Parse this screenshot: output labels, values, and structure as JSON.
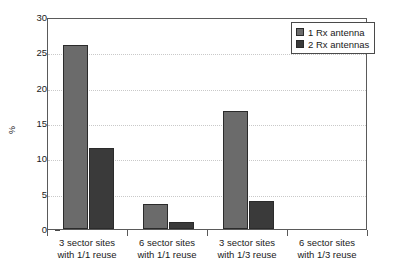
{
  "chart_data": {
    "type": "bar",
    "title": "",
    "xlabel": "",
    "ylabel": "%",
    "ylim": [
      0,
      30
    ],
    "ytick_labels": [
      "30",
      "25",
      "20",
      "15",
      "10",
      "5",
      "0"
    ],
    "yticks": [
      30,
      25,
      20,
      15,
      10,
      5,
      0
    ],
    "grid": true,
    "legend_position": "top-right",
    "categories": [
      "3 sector sites\nwith 1/1 reuse",
      "6 sector sites\nwith 1/1 reuse",
      "3 sector sites\nwith 1/3 reuse",
      "6 sector sites\nwith 1/3 reuse"
    ],
    "category_lines": [
      [
        "3 sector sites",
        "with 1/1 reuse"
      ],
      [
        "6 sector sites",
        "with 1/1 reuse"
      ],
      [
        "3 sector sites",
        "with 1/3 reuse"
      ],
      [
        "6 sector sites",
        "with 1/3 reuse"
      ]
    ],
    "series": [
      {
        "name": "1 Rx antenna",
        "color": "#6b6b6b",
        "values": [
          26.0,
          3.6,
          16.7,
          0.0
        ]
      },
      {
        "name": "2 Rx antennas",
        "color": "#3a3a3a",
        "values": [
          11.5,
          1.0,
          4.0,
          0.0
        ]
      }
    ]
  },
  "legend": {
    "items": [
      {
        "label": "1 Rx antenna",
        "color": "#6b6b6b"
      },
      {
        "label": "2 Rx antennas",
        "color": "#3a3a3a"
      }
    ]
  },
  "colors": {
    "series1": "#6b6b6b",
    "series2": "#3a3a3a",
    "axis": "#5a5a5a",
    "grid": "#c9c9c9",
    "text": "#1a1a1a",
    "background": "#ffffff"
  }
}
